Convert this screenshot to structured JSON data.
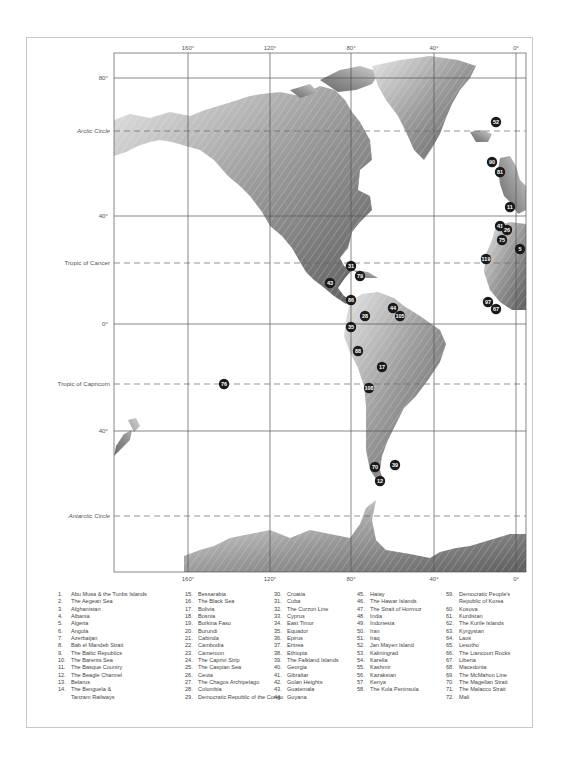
{
  "map": {
    "longitude_labels": [
      "160°",
      "120°",
      "80°",
      "40°",
      "0°"
    ],
    "latitude_labels": [
      "80°",
      "40°",
      "0°",
      "40°"
    ],
    "reference_lines": [
      "Arctic Circle",
      "Tropic of Cancer",
      "Tropic of Capricorn",
      "Antarctic Circle"
    ],
    "markers": [
      {
        "id": "52",
        "region": "Jan Mayen Island"
      },
      {
        "id": "90",
        "region": ""
      },
      {
        "id": "81",
        "region": ""
      },
      {
        "id": "11",
        "region": "The Basque Country"
      },
      {
        "id": "41",
        "region": "Gibraltar"
      },
      {
        "id": "26",
        "region": "Ceuta"
      },
      {
        "id": "75",
        "region": ""
      },
      {
        "id": "5",
        "region": "Algeria"
      },
      {
        "id": "119",
        "region": ""
      },
      {
        "id": "97",
        "region": ""
      },
      {
        "id": "67",
        "region": "Liberia"
      },
      {
        "id": "31",
        "region": "Cuba"
      },
      {
        "id": "79",
        "region": ""
      },
      {
        "id": "43",
        "region": "Guatemala"
      },
      {
        "id": "86",
        "region": ""
      },
      {
        "id": "28",
        "region": "Colombia"
      },
      {
        "id": "44",
        "region": "Guyana"
      },
      {
        "id": "105",
        "region": ""
      },
      {
        "id": "35",
        "region": "Equador"
      },
      {
        "id": "88",
        "region": ""
      },
      {
        "id": "17",
        "region": "Bolivia"
      },
      {
        "id": "108",
        "region": ""
      },
      {
        "id": "76",
        "region": ""
      },
      {
        "id": "70",
        "region": "The Magellan Strait"
      },
      {
        "id": "39",
        "region": "The Falkland Islands"
      },
      {
        "id": "12",
        "region": "The Beagle Channel"
      }
    ]
  },
  "legend": {
    "columns": [
      [
        {
          "n": "1.",
          "label": "Abu Musa & the Tunbs Islands"
        },
        {
          "n": "2.",
          "label": "The Aegean Sea"
        },
        {
          "n": "3.",
          "label": "Afghanistan"
        },
        {
          "n": "4.",
          "label": "Albania"
        },
        {
          "n": "5.",
          "label": "Algeria"
        },
        {
          "n": "6.",
          "label": "Angola"
        },
        {
          "n": "7.",
          "label": "Azerbaijan"
        },
        {
          "n": "8.",
          "label": "Bab el Mandeb Strait"
        },
        {
          "n": "9.",
          "label": "The Baltic Republics"
        },
        {
          "n": "10.",
          "label": "The Barents Sea"
        },
        {
          "n": "11.",
          "label": "The Basque Country"
        },
        {
          "n": "12.",
          "label": "The Beagle Channel"
        },
        {
          "n": "13.",
          "label": "Belarus"
        },
        {
          "n": "14.",
          "label": "The Benguela &\nTanzam Railways"
        }
      ],
      [
        {
          "n": "15.",
          "label": "Bessarabia"
        },
        {
          "n": "16.",
          "label": "The Black Sea"
        },
        {
          "n": "17.",
          "label": "Bolivia"
        },
        {
          "n": "18.",
          "label": "Bosnia"
        },
        {
          "n": "19.",
          "label": "Burkina Faso"
        },
        {
          "n": "20.",
          "label": "Burundi"
        },
        {
          "n": "21.",
          "label": "Cabinda"
        },
        {
          "n": "22.",
          "label": "Cambodia"
        },
        {
          "n": "23.",
          "label": "Cameroon"
        },
        {
          "n": "24.",
          "label": "The Caprivi Strip"
        },
        {
          "n": "25.",
          "label": "The Caspian Sea"
        },
        {
          "n": "26.",
          "label": "Ceuta"
        },
        {
          "n": "27.",
          "label": "The Chagos Archipelago"
        },
        {
          "n": "28.",
          "label": "Colombia"
        },
        {
          "n": "29.",
          "label": "Democratic Republic of the Congo"
        }
      ],
      [
        {
          "n": "30.",
          "label": "Croatia"
        },
        {
          "n": "31.",
          "label": "Cuba"
        },
        {
          "n": "32.",
          "label": "The Curzon Line"
        },
        {
          "n": "33.",
          "label": "Cyprus"
        },
        {
          "n": "34.",
          "label": "East Timor"
        },
        {
          "n": "35.",
          "label": "Equador"
        },
        {
          "n": "36.",
          "label": "Epirus"
        },
        {
          "n": "37.",
          "label": "Eritrea"
        },
        {
          "n": "38.",
          "label": "Ethiopia"
        },
        {
          "n": "39.",
          "label": "The Falkland Islands"
        },
        {
          "n": "40.",
          "label": "Georgia"
        },
        {
          "n": "41.",
          "label": "Gibraltar"
        },
        {
          "n": "42.",
          "label": "Golan Heights"
        },
        {
          "n": "43.",
          "label": "Guatemala"
        },
        {
          "n": "44.",
          "label": "Guyana"
        }
      ],
      [
        {
          "n": "45.",
          "label": "Hatay"
        },
        {
          "n": "46.",
          "label": "The Hawar Islands"
        },
        {
          "n": "47.",
          "label": "The Strait of Hormuz"
        },
        {
          "n": "48.",
          "label": "India"
        },
        {
          "n": "49.",
          "label": "Indonesia"
        },
        {
          "n": "50.",
          "label": "Iran"
        },
        {
          "n": "51.",
          "label": "Iraq"
        },
        {
          "n": "52.",
          "label": "Jan Mayen Island"
        },
        {
          "n": "53.",
          "label": "Kaliningrad"
        },
        {
          "n": "54.",
          "label": "Karelia"
        },
        {
          "n": "55.",
          "label": "Kashmir"
        },
        {
          "n": "56.",
          "label": "Kazakstan"
        },
        {
          "n": "57.",
          "label": "Kenya"
        },
        {
          "n": "58.",
          "label": "The Kola Peninsula"
        }
      ],
      [
        {
          "n": "59.",
          "label": "Democratic People's\nRepublic of Korea"
        },
        {
          "n": "60.",
          "label": "Kosova"
        },
        {
          "n": "61.",
          "label": "Kurdistan"
        },
        {
          "n": "62.",
          "label": "The Kurile Islands"
        },
        {
          "n": "63.",
          "label": "Kyrgystan"
        },
        {
          "n": "64.",
          "label": "Laos"
        },
        {
          "n": "65.",
          "label": "Lesotho"
        },
        {
          "n": "66.",
          "label": "The Liancourt Rocks"
        },
        {
          "n": "67.",
          "label": "Liberia"
        },
        {
          "n": "68.",
          "label": "Macedonia"
        },
        {
          "n": "69.",
          "label": "The McMahon Line"
        },
        {
          "n": "70.",
          "label": "The Magellan Strait"
        },
        {
          "n": "71.",
          "label": "The Malacco Strait"
        },
        {
          "n": "72.",
          "label": "Mali"
        }
      ]
    ]
  },
  "colors": {
    "land_light": "#d8d8d8",
    "land_dark": "#6a6a6a",
    "marker_fill": "#1a1a1a",
    "grid_line": "#555555",
    "frame": "#c8c8c8"
  }
}
